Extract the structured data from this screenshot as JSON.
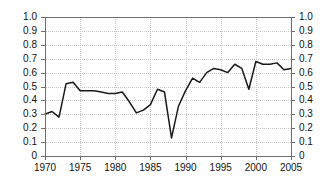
{
  "chart_data": {
    "type": "line",
    "title": "",
    "subtitle": "",
    "xlabel": "",
    "ylabel": "",
    "xlim": [
      1970,
      2005
    ],
    "ylim": [
      0,
      1.0
    ],
    "grid": true,
    "legend": null,
    "legend_position": "none",
    "line_color": "#1a1a1a",
    "axis_color": "#6f6f6f",
    "grid_color": "#c9c9c9",
    "x_ticks": [
      1970,
      1975,
      1980,
      1985,
      1990,
      1995,
      2000,
      2005
    ],
    "x_tick_labels": [
      "1970",
      "1975",
      "1980",
      "1985",
      "1990",
      "1995",
      "2000",
      "2005"
    ],
    "y_ticks": [
      0,
      0.1,
      0.2,
      0.3,
      0.4,
      0.5,
      0.6,
      0.7,
      0.8,
      0.9,
      1.0
    ],
    "y_tick_labels_left": [
      "0",
      "0.1",
      "0.2",
      "0.3",
      "0.4",
      "0.5",
      "0.6",
      "0.7",
      "0.8",
      "0.9",
      "1.0"
    ],
    "y_tick_labels_right": [
      "0",
      "0.1",
      "0.2",
      "0.3",
      "0.4",
      "0.5",
      "0.6",
      "0.7",
      "0.8",
      "0.9",
      "1.0"
    ],
    "y_axis_right_mirrored": true,
    "x": [
      1970,
      1971,
      1972,
      1973,
      1974,
      1975,
      1976,
      1977,
      1978,
      1979,
      1980,
      1981,
      1982,
      1983,
      1984,
      1985,
      1986,
      1987,
      1988,
      1989,
      1990,
      1991,
      1992,
      1993,
      1994,
      1995,
      1996,
      1997,
      1998,
      1999,
      2000,
      2001,
      2002,
      2003,
      2004,
      2005
    ],
    "values": [
      0.3,
      0.32,
      0.28,
      0.52,
      0.53,
      0.47,
      0.47,
      0.47,
      0.46,
      0.45,
      0.45,
      0.46,
      0.39,
      0.31,
      0.33,
      0.37,
      0.48,
      0.46,
      0.13,
      0.36,
      0.47,
      0.56,
      0.53,
      0.6,
      0.63,
      0.62,
      0.6,
      0.66,
      0.63,
      0.48,
      0.68,
      0.66,
      0.66,
      0.67,
      0.62,
      0.63
    ]
  }
}
